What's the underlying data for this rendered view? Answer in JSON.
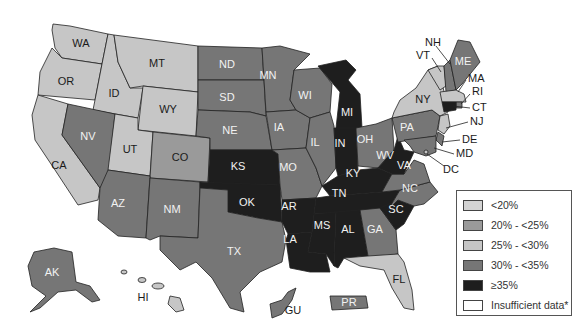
{
  "colors": {
    "lt20": "#d3d3d3",
    "20to25": "#9a9a9a",
    "25to30": "#c6c6c6",
    "30to35": "#767676",
    "ge35": "#1e1e1e",
    "insufficient": "#ffffff"
  },
  "legend": {
    "items": [
      {
        "key": "lt20",
        "label": "<20%"
      },
      {
        "key": "20to25",
        "label": "20% - <25%"
      },
      {
        "key": "25to30",
        "label": "25% - <30%"
      },
      {
        "key": "30to35",
        "label": "30% - <35%"
      },
      {
        "key": "ge35",
        "label": "≥35%"
      },
      {
        "key": "insufficient",
        "label": "Insufficient data*"
      }
    ]
  },
  "states": {
    "WA": {
      "label": "WA",
      "category": "25to30"
    },
    "OR": {
      "label": "OR",
      "category": "25to30"
    },
    "CA": {
      "label": "CA",
      "category": "25to30"
    },
    "ID": {
      "label": "ID",
      "category": "25to30"
    },
    "NV": {
      "label": "NV",
      "category": "30to35"
    },
    "MT": {
      "label": "MT",
      "category": "25to30"
    },
    "WY": {
      "label": "WY",
      "category": "25to30"
    },
    "UT": {
      "label": "UT",
      "category": "25to30"
    },
    "CO": {
      "label": "CO",
      "category": "20to25"
    },
    "AZ": {
      "label": "AZ",
      "category": "30to35"
    },
    "NM": {
      "label": "NM",
      "category": "30to35"
    },
    "ND": {
      "label": "ND",
      "category": "30to35"
    },
    "SD": {
      "label": "SD",
      "category": "30to35"
    },
    "NE": {
      "label": "NE",
      "category": "30to35"
    },
    "KS": {
      "label": "KS",
      "category": "ge35"
    },
    "OK": {
      "label": "OK",
      "category": "ge35"
    },
    "TX": {
      "label": "TX",
      "category": "30to35"
    },
    "MN": {
      "label": "MN",
      "category": "30to35"
    },
    "IA": {
      "label": "IA",
      "category": "30to35"
    },
    "MO": {
      "label": "MO",
      "category": "30to35"
    },
    "AR": {
      "label": "AR",
      "category": "ge35"
    },
    "LA": {
      "label": "LA",
      "category": "ge35"
    },
    "WI": {
      "label": "WI",
      "category": "30to35"
    },
    "IL": {
      "label": "IL",
      "category": "30to35"
    },
    "MI": {
      "label": "MI",
      "category": "ge35"
    },
    "IN": {
      "label": "IN",
      "category": "ge35"
    },
    "OH": {
      "label": "OH",
      "category": "30to35"
    },
    "KY": {
      "label": "KY",
      "category": "ge35"
    },
    "TN": {
      "label": "TN",
      "category": "ge35"
    },
    "MS": {
      "label": "MS",
      "category": "ge35"
    },
    "AL": {
      "label": "AL",
      "category": "ge35"
    },
    "GA": {
      "label": "GA",
      "category": "30to35"
    },
    "FL": {
      "label": "FL",
      "category": "25to30"
    },
    "SC": {
      "label": "SC",
      "category": "ge35"
    },
    "NC": {
      "label": "NC",
      "category": "30to35"
    },
    "VA": {
      "label": "VA",
      "category": "30to35"
    },
    "WV": {
      "label": "WV",
      "category": "ge35"
    },
    "PA": {
      "label": "PA",
      "category": "30to35"
    },
    "NY": {
      "label": "NY",
      "category": "25to30"
    },
    "VT": {
      "label": "VT",
      "category": "25to30"
    },
    "NH": {
      "label": "NH",
      "category": "30to35"
    },
    "ME": {
      "label": "ME",
      "category": "30to35"
    },
    "MA": {
      "label": "MA",
      "category": "25to30"
    },
    "RI": {
      "label": "RI",
      "category": "30to35"
    },
    "CT": {
      "label": "CT",
      "category": "ge35"
    },
    "NJ": {
      "label": "NJ",
      "category": "25to30"
    },
    "DE": {
      "label": "DE",
      "category": "30to35"
    },
    "MD": {
      "label": "MD",
      "category": "30to35"
    },
    "DC": {
      "label": "DC",
      "category": "25to30"
    },
    "AK": {
      "label": "AK",
      "category": "30to35"
    },
    "HI": {
      "label": "HI",
      "category": "25to30"
    },
    "GU": {
      "label": "GU",
      "category": "30to35"
    },
    "PR": {
      "label": "PR",
      "category": "30to35"
    }
  }
}
